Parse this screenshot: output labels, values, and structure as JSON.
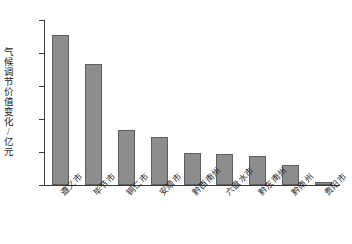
{
  "chart_data": {
    "type": "bar",
    "title": "",
    "xlabel": "",
    "ylabel": "气候调节价值变化/亿元",
    "ylim": [
      0,
      250
    ],
    "yticks": [
      0,
      50,
      100,
      150,
      200,
      250
    ],
    "grid": false,
    "legend": "none",
    "bar_color": "#8d8d8d",
    "bar_edge_color": "#5e5e5e",
    "axis_color": "#3a3a3a",
    "categories": [
      "遵义市",
      "毕节市",
      "铜仁市",
      "安顺市",
      "黔西南州",
      "六盘水市",
      "黔东南州",
      "黔南州",
      "贵阳市"
    ],
    "values": [
      227,
      183,
      84,
      73,
      48,
      47,
      44,
      30,
      5
    ]
  }
}
